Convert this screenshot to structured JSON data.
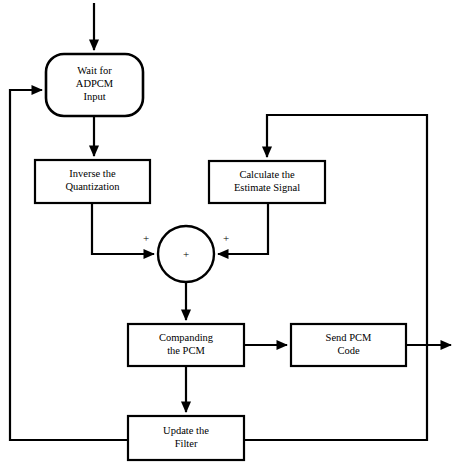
{
  "diagram": {
    "type": "flowchart",
    "background_color": "#ffffff",
    "line_color": "#000000",
    "nodes": [
      {
        "id": "wait",
        "name": "wait-for-adpcm-input",
        "shape": "rounded-rectangle",
        "lines": [
          "Wait for",
          "ADPCM",
          "Input"
        ],
        "x": 46,
        "y": 54,
        "width": 97,
        "height": 62,
        "radius": 18
      },
      {
        "id": "inverse",
        "name": "inverse-the-quantization",
        "shape": "rectangle",
        "lines": [
          "Inverse the",
          "Quantization"
        ],
        "x": 35,
        "y": 160,
        "width": 115,
        "height": 43
      },
      {
        "id": "calculate",
        "name": "calculate-the-estimate-signal",
        "shape": "rectangle",
        "lines": [
          "Calculate the",
          "Estimate Signal"
        ],
        "x": 209,
        "y": 161,
        "width": 116,
        "height": 42
      },
      {
        "id": "sum",
        "name": "summing-junction",
        "shape": "circle",
        "lines": [],
        "cx": 186,
        "cy": 254,
        "r": 28
      },
      {
        "id": "companding",
        "name": "companding-the-pcm",
        "shape": "rectangle",
        "lines": [
          "Companding",
          "the PCM"
        ],
        "x": 128,
        "y": 324,
        "width": 116,
        "height": 42
      },
      {
        "id": "send",
        "name": "send-pcm-code",
        "shape": "rectangle",
        "lines": [
          "Send PCM",
          "Code"
        ],
        "x": 291,
        "y": 324,
        "width": 115,
        "height": 42
      },
      {
        "id": "update",
        "name": "update-the-filter",
        "shape": "rectangle",
        "lines": [
          "Update the",
          "Filter"
        ],
        "x": 128,
        "y": 416,
        "width": 116,
        "height": 44
      }
    ],
    "signs": [
      {
        "name": "plus-sign-left-input",
        "label": "+",
        "x": 146,
        "y": 239
      },
      {
        "name": "plus-sign-right-input",
        "label": "+",
        "x": 226,
        "y": 239
      },
      {
        "name": "plus-sign-center",
        "label": "+",
        "x": 186,
        "y": 255
      }
    ],
    "edges": [
      {
        "name": "edge-input-to-wait",
        "path": "M 94 3 L 94 50",
        "arrow": "end"
      },
      {
        "name": "edge-wait-to-inverse",
        "path": "M 94 116 L 94 156",
        "arrow": "end"
      },
      {
        "name": "edge-inverse-to-sum",
        "path": "M 92 203 L 92 254 L 154 254",
        "arrow": "end"
      },
      {
        "name": "edge-calculate-to-sum",
        "path": "M 268 203 L 268 254 L 218 254",
        "arrow": "end"
      },
      {
        "name": "edge-sum-to-companding",
        "path": "M 186 282 L 186 320",
        "arrow": "end"
      },
      {
        "name": "edge-companding-to-send",
        "path": "M 244 345 L 287 345",
        "arrow": "end"
      },
      {
        "name": "edge-send-to-output",
        "path": "M 406 345 L 451 345",
        "arrow": "end"
      },
      {
        "name": "edge-companding-to-update",
        "path": "M 186 366 L 186 412",
        "arrow": "end"
      },
      {
        "name": "edge-update-feedback-to-wait",
        "path": "M 128 440 L 10 440 L 10 90 L 42 90",
        "arrow": "end"
      },
      {
        "name": "edge-update-feedback-to-calculate",
        "path": "M 244 440 L 427 440 L 427 115 L 267 115 L 267 157",
        "arrow": "end"
      }
    ]
  }
}
